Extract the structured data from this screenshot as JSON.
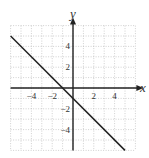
{
  "chart_data": {
    "type": "line",
    "title": "",
    "xlabel": "x",
    "ylabel": "y",
    "xlim": [
      -6,
      6
    ],
    "ylim": [
      -6,
      6
    ],
    "grid": true,
    "grid_style": "dotted",
    "x_ticks": [
      -4,
      -2,
      2,
      4
    ],
    "y_ticks": [
      4,
      2,
      -2,
      -4
    ],
    "x_tick_labels": [
      "−4",
      "−2",
      "2",
      "4"
    ],
    "y_tick_labels": [
      "4",
      "2",
      "−2",
      "−4"
    ],
    "series": [
      {
        "name": "y = -x - 1",
        "x": [
          -6,
          5
        ],
        "y": [
          5,
          -6
        ],
        "color": "#222222"
      }
    ],
    "legend": null
  },
  "colors": {
    "axis": "#222222",
    "grid": "#b0b0b0",
    "line": "#222222",
    "text": "#333333"
  }
}
